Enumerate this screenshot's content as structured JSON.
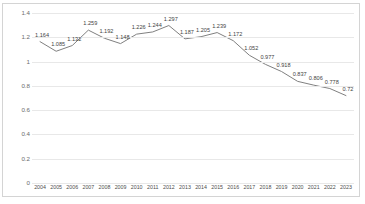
{
  "chart_data": {
    "type": "line",
    "title": "",
    "subtitle": "",
    "xlabel": "",
    "ylabel": "",
    "categories": [
      "2004",
      "2005",
      "2006",
      "2007",
      "2008",
      "2009",
      "2010",
      "2011",
      "2012",
      "2013",
      "2014",
      "2015",
      "2016",
      "2017",
      "2018",
      "2019",
      "2020",
      "2021",
      "2022",
      "2023"
    ],
    "values": [
      1.164,
      1.085,
      1.132,
      1.259,
      1.192,
      1.148,
      1.226,
      1.244,
      1.297,
      1.187,
      1.205,
      1.239,
      1.172,
      1.052,
      0.977,
      0.918,
      0.837,
      0.806,
      0.778,
      0.72
    ],
    "data_labels": [
      "1.164",
      "1.085",
      "1.132",
      "1.259",
      "1.192",
      "1.148",
      "1.226",
      "1.244",
      "1.297",
      "1.187",
      "1.205",
      "1.239",
      "1.172",
      "1.052",
      "0.977",
      "0.918",
      "0.837",
      "0.806",
      "0.778",
      "0.72"
    ],
    "series": [
      {
        "name": "",
        "values": [
          1.164,
          1.085,
          1.132,
          1.259,
          1.192,
          1.148,
          1.226,
          1.244,
          1.297,
          1.187,
          1.205,
          1.239,
          1.172,
          1.052,
          0.977,
          0.918,
          0.837,
          0.806,
          0.778,
          0.72
        ],
        "color": "#808080"
      }
    ],
    "ylim": [
      0,
      1.4
    ],
    "yticks": [
      0,
      0.2,
      0.4,
      0.6,
      0.8,
      1,
      1.2,
      1.4
    ],
    "ytick_labels": [
      "0",
      "0.2",
      "0.4",
      "0.6",
      "0.8",
      "1",
      "1.2",
      "1.4"
    ],
    "grid": true,
    "grid_color": "#e8e8e8",
    "legend": false,
    "legend_position": "none",
    "line_color": "#808080",
    "border_color": "#d4d4d4",
    "background": "#ffffff",
    "markers": false
  }
}
